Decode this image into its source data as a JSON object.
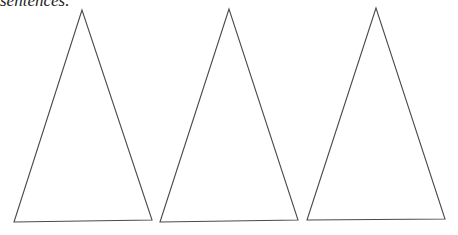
{
  "caption": "sentences.",
  "triangles": [
    {
      "name": "triangle-1",
      "points": "82,10 14,222 152,220"
    },
    {
      "name": "triangle-2",
      "points": "229,9 160,222 298,220"
    },
    {
      "name": "triangle-3",
      "points": "376,8 307,220 445,219"
    }
  ],
  "colors": {
    "stroke": "#4a4a4a",
    "background": "#ffffff"
  }
}
